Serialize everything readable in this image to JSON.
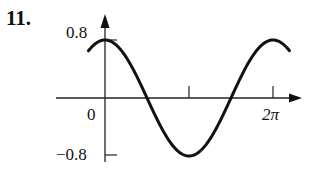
{
  "problem": {
    "number": "11."
  },
  "chart_data": {
    "type": "line",
    "title": "",
    "xlabel": "",
    "ylabel": "",
    "function": "y = 0.8 cos(x)",
    "x_tick_labels": [
      "0",
      "2π"
    ],
    "x_ticks": [
      0,
      3.14159,
      6.28319
    ],
    "y_tick_labels": [
      "0.8",
      "−0.8"
    ],
    "y_ticks": [
      0.8,
      -0.8
    ],
    "xlim": [
      -0.7,
      7.0
    ],
    "ylim": [
      -0.8,
      0.8
    ],
    "grid": false,
    "legend": null,
    "series": [
      {
        "name": "0.8cos(x)",
        "x": [
          -0.7,
          -0.35,
          0,
          0.785,
          1.571,
          2.356,
          3.142,
          3.927,
          4.712,
          5.498,
          6.283,
          6.63,
          6.98
        ],
        "values": [
          0.61,
          0.75,
          0.8,
          0.57,
          0.0,
          -0.57,
          -0.8,
          -0.57,
          0.0,
          0.57,
          0.8,
          0.75,
          0.61
        ]
      }
    ]
  },
  "labels": {
    "y_max": "0.8",
    "origin": "0",
    "y_min": "−0.8",
    "x_end": "2π"
  },
  "colors": {
    "ink": "#111111",
    "background": "#ffffff"
  }
}
